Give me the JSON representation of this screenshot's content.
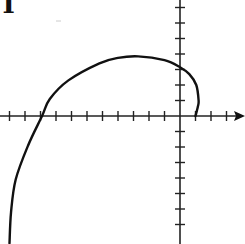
{
  "chart_data": {
    "type": "line",
    "title": "",
    "xlabel": "",
    "ylabel": "",
    "grid": false,
    "legend": null,
    "axes": {
      "origin_px": [
        180,
        116
      ],
      "unit_px": 15.5,
      "x_ticks": [
        -11,
        -10,
        -9,
        -8,
        -7,
        -6,
        -5,
        -4,
        -3,
        -2,
        -1,
        1,
        2,
        3
      ],
      "y_ticks": [
        -7,
        -6,
        -5,
        -4,
        -3,
        -2,
        -1,
        1,
        2,
        3,
        4,
        5,
        6,
        7
      ],
      "x_arrow": true,
      "y_arrow": false,
      "xlim": [
        -11.6,
        4.2
      ],
      "ylim": [
        -8.2,
        7.5
      ]
    },
    "series": [
      {
        "name": "curve",
        "color": "#111111",
        "points": [
          [
            1,
            0
          ],
          [
            1.15,
            0.6
          ],
          [
            1.2,
            1.0
          ],
          [
            1.05,
            2.0
          ],
          [
            0.6,
            2.7
          ],
          [
            0,
            3.15
          ],
          [
            -1,
            3.6
          ],
          [
            -2.7,
            3.85
          ],
          [
            -4,
            3.75
          ],
          [
            -5.2,
            3.4
          ],
          [
            -7.2,
            2.3
          ],
          [
            -8.4,
            1.1
          ],
          [
            -8.9,
            0
          ],
          [
            -9.8,
            -1.9
          ],
          [
            -10.6,
            -4.1
          ],
          [
            -10.9,
            -6.2
          ],
          [
            -11.0,
            -8.2
          ]
        ]
      }
    ]
  },
  "annotations": {
    "corner_glyph": "T"
  }
}
